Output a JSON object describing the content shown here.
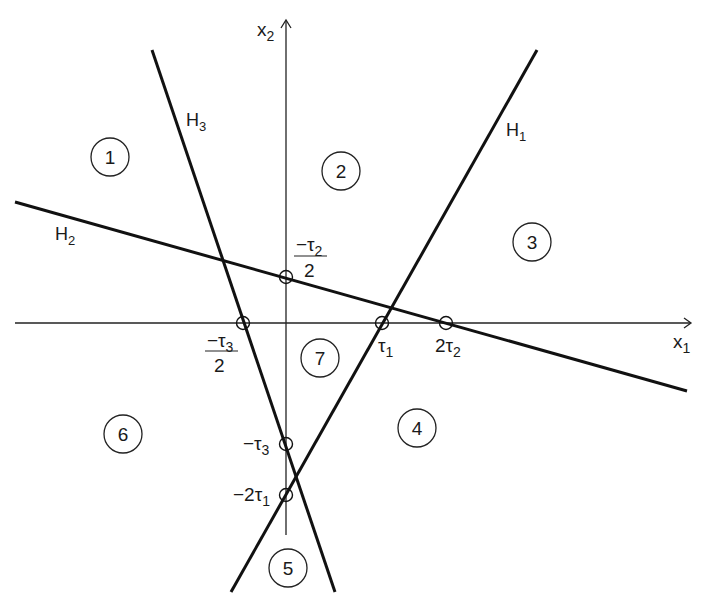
{
  "diagram": {
    "type": "hyperplane-arrangement",
    "axes": {
      "x_label": "x",
      "x_sub": "1",
      "y_label": "x",
      "y_sub": "2"
    },
    "lines": [
      {
        "id": "H1",
        "label": "H",
        "sub": "1"
      },
      {
        "id": "H2",
        "label": "H",
        "sub": "2"
      },
      {
        "id": "H3",
        "label": "H",
        "sub": "3"
      }
    ],
    "intercepts": {
      "neg_tau2_half": {
        "num": "−τ",
        "num_sub": "2",
        "den": "2"
      },
      "neg_tau3_half": {
        "num": "−τ",
        "num_sub": "3",
        "den": "2"
      },
      "tau1": {
        "text": "τ",
        "sub": "1"
      },
      "two_tau2": {
        "text": "2τ",
        "sub": "2"
      },
      "neg_tau3": {
        "text": "−τ",
        "sub": "3"
      },
      "neg_two_tau1": {
        "text": "−2τ",
        "sub": "1"
      }
    },
    "regions": [
      "1",
      "2",
      "3",
      "4",
      "5",
      "6",
      "7"
    ]
  }
}
